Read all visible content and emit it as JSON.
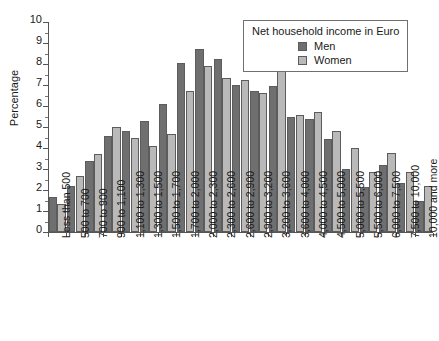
{
  "chart_data": {
    "type": "bar",
    "title": "",
    "subtitle": "",
    "xlabel": "",
    "ylabel": "Percentage",
    "ylim": [
      0,
      10
    ],
    "ytick_step": 1,
    "yticks": [
      "0",
      "1",
      "2",
      "3",
      "4",
      "5",
      "6",
      "7",
      "8",
      "9",
      "10"
    ],
    "grid": false,
    "legend_position": "top-right",
    "legend_title": "Net household income in Euro",
    "categories": [
      "Less than 500",
      "500 to 700",
      "700 to 900",
      "900 to 1,100",
      "1,100 to 1,300",
      "1,300 to 1,500",
      "1,500 to 1,700",
      "1,700 to 2,000",
      "2,000 to 2,300",
      "2,300 to 2,600",
      "2,600 to 2,900",
      "2,900 to 3,200",
      "3,200 to 3,600",
      "3,600 to 4,000",
      "4,000 to 4,500",
      "4,500 to 5,000",
      "5,000 to 5,500",
      "5,500 to 6,000",
      "6,000 to 7,500",
      "7,500 to 10,000",
      "10,000 and more"
    ],
    "series": [
      {
        "name": "Men",
        "color": "#6f6f6f",
        "values": [
          1.65,
          2.2,
          3.4,
          4.55,
          4.8,
          5.3,
          6.1,
          8.05,
          8.7,
          8.25,
          7.0,
          6.7,
          6.95,
          5.5,
          5.4,
          4.45,
          3.0,
          2.15,
          3.2,
          2.35,
          1.5
        ]
      },
      {
        "name": "Women",
        "color": "#b9b9b9",
        "values": [
          1.35,
          2.65,
          3.7,
          5.0,
          4.5,
          4.1,
          4.65,
          6.7,
          7.9,
          7.35,
          7.25,
          6.6,
          7.65,
          5.55,
          5.7,
          4.8,
          4.0,
          2.85,
          3.75,
          2.85,
          2.2
        ]
      }
    ]
  },
  "legend": {
    "title": "Net household income in Euro",
    "entries": [
      {
        "label": "Men",
        "swatch": "men-swatch"
      },
      {
        "label": "Women",
        "swatch": "women-swatch"
      }
    ]
  },
  "axes": {
    "y_title": "Percentage"
  }
}
